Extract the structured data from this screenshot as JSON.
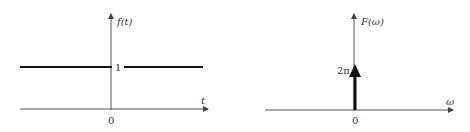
{
  "colors": {
    "axis": "#444444",
    "signal": "#111111",
    "text": "#333333",
    "background": "#ffffff"
  },
  "left_plot": {
    "y_label": "f(t)",
    "x_label": "t",
    "origin_label": "0",
    "level_label": "1",
    "description": "Constant signal f(t)=1 for all t"
  },
  "right_plot": {
    "y_label": "F(ω)",
    "x_label": "ω",
    "origin_label": "0",
    "impulse_label": "2π",
    "description": "Impulse of weight 2π at ω=0"
  }
}
